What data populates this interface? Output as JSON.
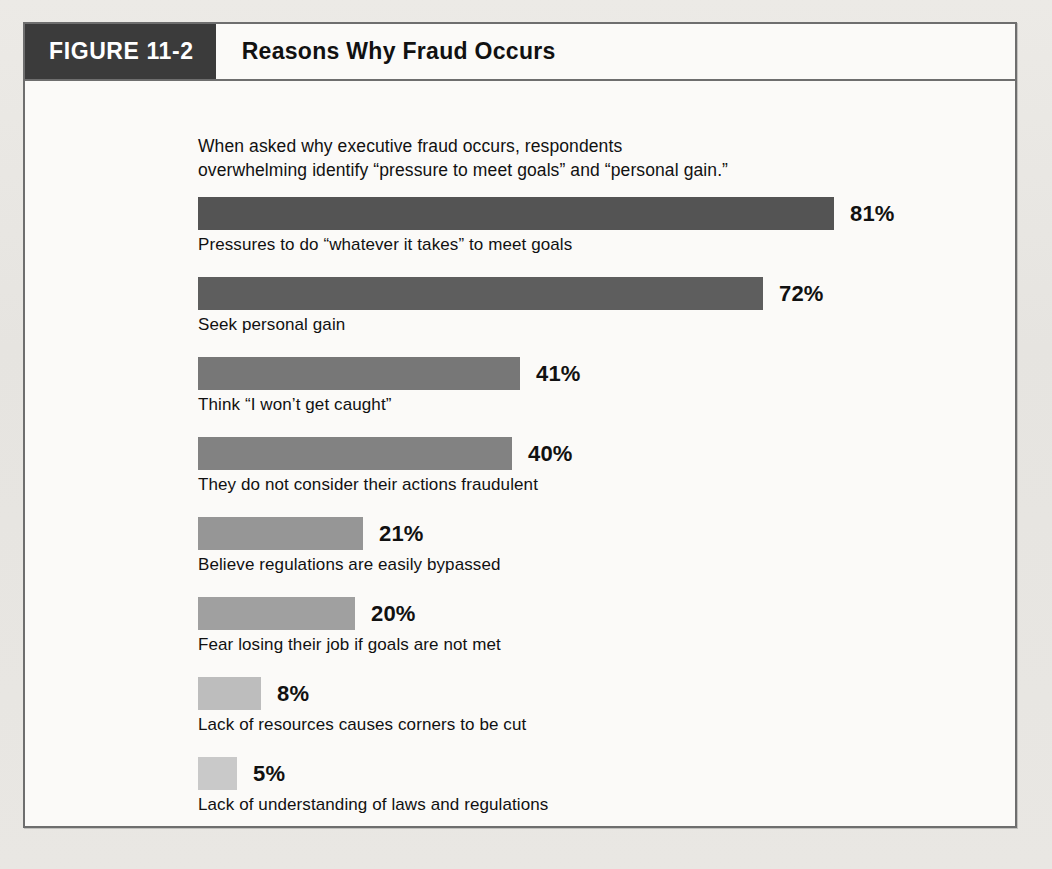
{
  "figure": {
    "tag": "FIGURE 11-2",
    "title": "Reasons Why Fraud Occurs",
    "intro": "When asked why executive fraud occurs, respondents\noverwhelming identify “pressure to meet goals” and “personal gain.”"
  },
  "chart_data": {
    "type": "bar",
    "orientation": "horizontal",
    "title": "Reasons Why Fraud Occurs",
    "subtitle": "When asked why executive fraud occurs, respondents overwhelming identify “pressure to meet goals” and “personal gain.”",
    "xlabel": "",
    "ylabel": "",
    "xlim": [
      0,
      100
    ],
    "grid": false,
    "legend": null,
    "value_suffix": "%",
    "categories": [
      "Pressures to do “whatever it takes” to meet goals",
      "Seek personal gain",
      "Think “I won’t get caught”",
      "They do not consider their actions fraudulent",
      "Believe regulations are easily bypassed",
      "Fear losing their job if goals are not met",
      "Lack of resources causes corners to be cut",
      "Lack of understanding of laws and regulations"
    ],
    "values": [
      81,
      72,
      41,
      40,
      21,
      20,
      8,
      5
    ],
    "value_labels": [
      "81%",
      "72%",
      "41%",
      "40%",
      "21%",
      "20%",
      "8%",
      "5%"
    ],
    "bar_colors": [
      "#545454",
      "#5e5e5e",
      "#777777",
      "#828282",
      "#969696",
      "#a0a0a0",
      "#bdbdbd",
      "#c9c9c9"
    ],
    "bars": [
      {
        "label": "Pressures to do “whatever it takes” to meet goals",
        "value": 81,
        "value_label": "81%",
        "color": "#545454"
      },
      {
        "label": "Seek personal gain",
        "value": 72,
        "value_label": "72%",
        "color": "#5e5e5e"
      },
      {
        "label": "Think “I won’t get caught”",
        "value": 41,
        "value_label": "41%",
        "color": "#777777"
      },
      {
        "label": "They do not consider their actions fraudulent",
        "value": 40,
        "value_label": "40%",
        "color": "#828282"
      },
      {
        "label": "Believe regulations are easily bypassed",
        "value": 21,
        "value_label": "21%",
        "color": "#969696"
      },
      {
        "label": "Fear losing their job if goals are not met",
        "value": 20,
        "value_label": "20%",
        "color": "#a0a0a0"
      },
      {
        "label": "Lack of resources causes corners to be cut",
        "value": 8,
        "value_label": "8%",
        "color": "#bdbdbd"
      },
      {
        "label": "Lack of understanding of laws and regulations",
        "value": 5,
        "value_label": "5%",
        "color": "#c9c9c9"
      }
    ]
  },
  "colors": {
    "header_tag_bg": "#3b3b3b",
    "frame_border": "#6e6e6e",
    "page_bg": "#e8e6e2",
    "figure_bg": "#fbfaf8"
  }
}
